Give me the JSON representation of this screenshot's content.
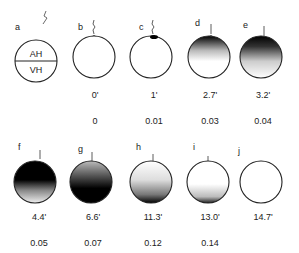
{
  "figure": {
    "row1": [
      {
        "letter": "a",
        "time": "",
        "fraction": "",
        "compartments": [
          "AH",
          "VH"
        ]
      },
      {
        "letter": "b",
        "time": "0'",
        "fraction": "0"
      },
      {
        "letter": "c",
        "time": "1'",
        "fraction": "0.01"
      },
      {
        "letter": "d",
        "time": "2.7'",
        "fraction": "0.03"
      },
      {
        "letter": "e",
        "time": "3.2'",
        "fraction": "0.04"
      }
    ],
    "row2": [
      {
        "letter": "f",
        "time": "4.4'",
        "fraction": "0.05"
      },
      {
        "letter": "g",
        "time": "6.6'",
        "fraction": "0.07"
      },
      {
        "letter": "h",
        "time": "11.3'",
        "fraction": "0.12"
      },
      {
        "letter": "i",
        "time": "13.0'",
        "fraction": "0.14"
      },
      {
        "letter": "j",
        "time": "14.7'",
        "fraction": "0.15"
      }
    ]
  },
  "labels": {
    "ah": "AH",
    "vh": "VH"
  }
}
